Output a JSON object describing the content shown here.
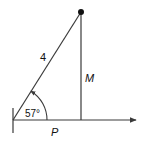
{
  "diagram": {
    "hypotenuse_label": "4",
    "vertical_label": "M",
    "horizontal_label": "P",
    "angle_label": "57°",
    "angle_degrees": 57,
    "hypotenuse_length": 4,
    "colors": {
      "line": "#3a3a3a",
      "point": "#111111",
      "text": "#111111"
    }
  }
}
